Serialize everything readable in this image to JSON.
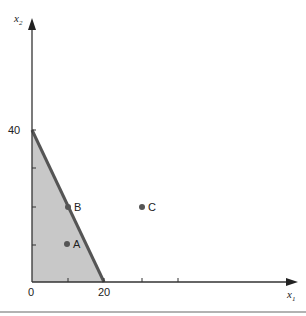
{
  "axes": {
    "x_label": "x",
    "x_sub": "1",
    "y_label": "x",
    "y_sub": "2",
    "x_tick_labels": [
      "0",
      "20"
    ],
    "y_tick_labels": [
      "40"
    ]
  },
  "region": {
    "fill": "#c8c8c8",
    "boundary_color": "#555555",
    "vertices": [
      [
        0,
        0
      ],
      [
        0,
        40
      ],
      [
        20,
        0
      ]
    ]
  },
  "points": [
    {
      "label": "A",
      "x": 10,
      "y": 10
    },
    {
      "label": "B",
      "x": 10,
      "y": 20
    },
    {
      "label": "C",
      "x": 30,
      "y": 20
    }
  ],
  "colors": {
    "axis": "#333333",
    "point": "#555555"
  }
}
